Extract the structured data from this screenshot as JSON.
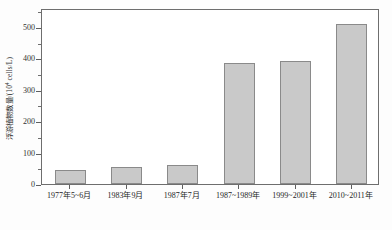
{
  "chart_data": {
    "type": "bar",
    "title": "",
    "subtitle": "",
    "xlabel": "",
    "ylabel": "浮游植物数量/(10⁴ cells/L)",
    "ylabel_text": "浮游植物数量/(10",
    "ylabel_exponent": "4",
    "ylabel_tail": " cells/L)",
    "categories": [
      "1977年5~6月",
      "1983年9月",
      "1987年7月",
      "1987~1989年",
      "1999~2001年",
      "2010~2011年"
    ],
    "values": [
      45,
      55,
      62,
      385,
      390,
      510
    ],
    "ylim": [
      0,
      560
    ],
    "ytick_major": [
      0,
      100,
      200,
      300,
      400,
      500
    ],
    "ytick_minor": [
      50,
      150,
      250,
      350,
      450,
      550
    ],
    "ytick_labels": [
      "0",
      "100",
      "200",
      "300",
      "400",
      "500"
    ],
    "grid": false,
    "legend": null,
    "bar_fill_color": "#c9c9c9",
    "bar_border_color": "#8a8a8a",
    "axis_color": "#6e6e6e",
    "background_color": "#ffffff"
  }
}
